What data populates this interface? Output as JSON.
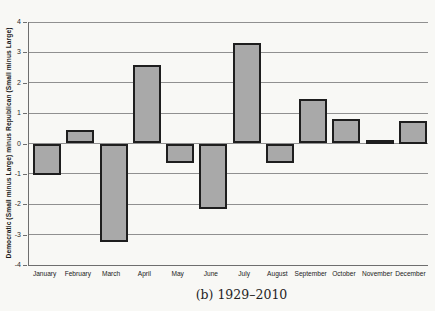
{
  "chart_data": {
    "type": "bar",
    "categories": [
      "January",
      "February",
      "March",
      "April",
      "May",
      "June",
      "July",
      "August",
      "September",
      "October",
      "November",
      "December"
    ],
    "values": [
      -1.05,
      0.45,
      -3.25,
      2.6,
      -0.65,
      -2.15,
      3.3,
      -0.65,
      1.45,
      0.8,
      0.05,
      0.75
    ],
    "title": "",
    "xlabel": "",
    "ylabel": "Democratic (Small minus Large) minus Republican (Small minus Large)",
    "ylim": [
      -4,
      4
    ],
    "yticks": [
      4,
      3,
      2,
      1,
      0,
      -1,
      -2,
      -3,
      -4
    ],
    "grid": true,
    "legend": "none",
    "bar_fill": "#a9a9a9",
    "bar_border": "#1e1e1e",
    "gridline_color": "#909090",
    "axis_color": "#6e6e6e",
    "background_color": "#f8f8f5"
  },
  "caption": "(b) 1929–2010"
}
